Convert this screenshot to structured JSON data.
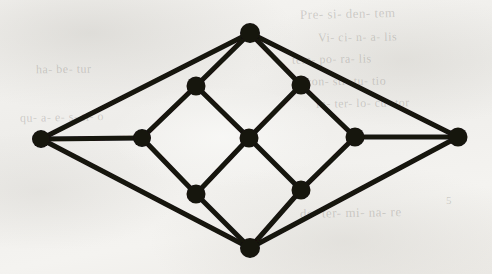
{
  "figure": {
    "background_color": "#f2f1ee",
    "ink_color": "#141210",
    "vertex_radius": 9,
    "edge_width": 5
  },
  "graph": {
    "vertex_count": 11,
    "edge_count": 16,
    "vertices": [
      {
        "id": "left-apex",
        "label": "left apex",
        "x": 41,
        "y": 139,
        "r": 9,
        "degree": 3
      },
      {
        "id": "right-apex",
        "label": "right apex",
        "x": 458,
        "y": 137,
        "r": 9.5,
        "degree": 3
      },
      {
        "id": "top-apex",
        "label": "top apex",
        "x": 250,
        "y": 33,
        "r": 10,
        "degree": 4
      },
      {
        "id": "bottom-apex",
        "label": "bottom apex",
        "x": 250,
        "y": 248,
        "r": 10,
        "degree": 4
      },
      {
        "id": "upper-left",
        "label": "upper left inner",
        "x": 196,
        "y": 86,
        "r": 9.5,
        "degree": 3
      },
      {
        "id": "upper-right",
        "label": "upper right inner",
        "x": 301,
        "y": 85,
        "r": 9.5,
        "degree": 3
      },
      {
        "id": "mid-left",
        "label": "middle left inner",
        "x": 142,
        "y": 138,
        "r": 9,
        "degree": 3
      },
      {
        "id": "center",
        "label": "center",
        "x": 249,
        "y": 138,
        "r": 9.5,
        "degree": 4
      },
      {
        "id": "mid-right",
        "label": "middle right inner",
        "x": 355,
        "y": 137,
        "r": 9.5,
        "degree": 3
      },
      {
        "id": "lower-left",
        "label": "lower left inner",
        "x": 196,
        "y": 194,
        "r": 9.5,
        "degree": 3
      },
      {
        "id": "lower-right",
        "label": "lower right inner",
        "x": 301,
        "y": 190,
        "r": 9.5,
        "degree": 3
      }
    ],
    "edges": [
      {
        "id": "e1",
        "from": "left-apex",
        "to": "top-apex"
      },
      {
        "id": "e2",
        "from": "left-apex",
        "to": "mid-left"
      },
      {
        "id": "e3",
        "from": "left-apex",
        "to": "bottom-apex"
      },
      {
        "id": "e4",
        "from": "right-apex",
        "to": "top-apex"
      },
      {
        "id": "e5",
        "from": "right-apex",
        "to": "mid-right"
      },
      {
        "id": "e6",
        "from": "right-apex",
        "to": "bottom-apex"
      },
      {
        "id": "e7",
        "from": "top-apex",
        "to": "upper-left"
      },
      {
        "id": "e8",
        "from": "top-apex",
        "to": "upper-right"
      },
      {
        "id": "e9",
        "from": "bottom-apex",
        "to": "lower-left"
      },
      {
        "id": "e10",
        "from": "bottom-apex",
        "to": "lower-right"
      },
      {
        "id": "e11",
        "from": "upper-left",
        "to": "mid-left"
      },
      {
        "id": "e12",
        "from": "upper-left",
        "to": "center"
      },
      {
        "id": "e13",
        "from": "upper-right",
        "to": "center"
      },
      {
        "id": "e14",
        "from": "upper-right",
        "to": "mid-right"
      },
      {
        "id": "e15",
        "from": "mid-left",
        "to": "lower-left"
      },
      {
        "id": "e16",
        "from": "center",
        "to": "lower-left"
      },
      {
        "id": "e17",
        "from": "center",
        "to": "lower-right"
      },
      {
        "id": "e18",
        "from": "mid-right",
        "to": "lower-right"
      }
    ]
  },
  "bleed_through": [
    {
      "id": "b1",
      "text": "Pre- si- den- tem",
      "x": 300,
      "y": 6,
      "size": 13,
      "rotate": -1.2
    },
    {
      "id": "b2",
      "text": "Vi- ci- n- a- lis",
      "x": 318,
      "y": 30,
      "size": 12,
      "rotate": -0.8
    },
    {
      "id": "b3",
      "text": "tem- po- ra- lis",
      "x": 292,
      "y": 52,
      "size": 12,
      "rotate": -1.0
    },
    {
      "id": "b4",
      "text": "con- sti- tu- tio",
      "x": 306,
      "y": 74,
      "size": 12,
      "rotate": -0.6
    },
    {
      "id": "b5",
      "text": "in- ter- lo- cu- tor",
      "x": 316,
      "y": 96,
      "size": 12,
      "rotate": -0.9
    },
    {
      "id": "b6",
      "text": "de- ter- mi- na- re",
      "x": 300,
      "y": 205,
      "size": 13,
      "rotate": -1.0
    },
    {
      "id": "b7",
      "text": "5",
      "x": 446,
      "y": 194,
      "size": 11,
      "rotate": 0
    },
    {
      "id": "b8",
      "text": "qu- a- e- s- ti- o",
      "x": 20,
      "y": 110,
      "size": 12,
      "rotate": -1.1
    },
    {
      "id": "b9",
      "text": "ha- be- tur",
      "x": 36,
      "y": 62,
      "size": 12,
      "rotate": -0.7
    }
  ]
}
